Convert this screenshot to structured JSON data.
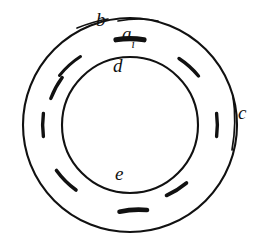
{
  "figure": {
    "type": "annular-ring-diagram",
    "background_color": "#ffffff",
    "stroke_color": "#111111",
    "labels": [
      {
        "id": "b",
        "text": "b",
        "subscript": "",
        "description": "label for outer dashed arc segment, upper left"
      },
      {
        "id": "a",
        "text": "a",
        "subscript": "i",
        "description": "label for thick top dash element"
      },
      {
        "id": "d",
        "text": "d",
        "subscript": "",
        "description": "label for inner circle boundary"
      },
      {
        "id": "c",
        "text": "c",
        "subscript": "",
        "description": "label for outer circle boundary"
      },
      {
        "id": "e",
        "text": "e",
        "subscript": "",
        "description": "label for inner disc region"
      }
    ],
    "circles": [
      {
        "id": "outer-circle",
        "cx": 130,
        "cy": 125,
        "r": 107,
        "label_ref": "c"
      },
      {
        "id": "inner-circle",
        "cx": 130,
        "cy": 125,
        "r": 68,
        "label_ref": "d"
      }
    ],
    "dashes": {
      "count": 9,
      "ring_radius": 87,
      "description": "short arc segments spaced around the annulus between the inner and outer circles",
      "items": [
        {
          "id": "dash-top",
          "angle_deg": 270,
          "length_deg": 17,
          "thick": true,
          "label_ref": "a"
        },
        {
          "id": "dash-upper-left",
          "angle_deg": 225,
          "length_deg": 15,
          "thick": false,
          "label_ref": "b"
        },
        {
          "id": "dash-upper-left2",
          "angle_deg": 208,
          "length_deg": 14,
          "thick": false,
          "label_ref": ""
        },
        {
          "id": "dash-left",
          "angle_deg": 180,
          "length_deg": 15,
          "thick": false,
          "label_ref": ""
        },
        {
          "id": "dash-lower-left",
          "angle_deg": 140,
          "length_deg": 15,
          "thick": false,
          "label_ref": ""
        },
        {
          "id": "dash-bottom",
          "angle_deg": 90,
          "length_deg": 14,
          "thick": true,
          "label_ref": ""
        },
        {
          "id": "dash-lower-right",
          "angle_deg": 42,
          "length_deg": 15,
          "thick": false,
          "label_ref": ""
        },
        {
          "id": "dash-right",
          "angle_deg": 0,
          "length_deg": 15,
          "thick": false,
          "label_ref": ""
        },
        {
          "id": "dash-upper-right",
          "angle_deg": 322,
          "length_deg": 14,
          "thick": false,
          "label_ref": ""
        }
      ]
    },
    "leaders": [
      {
        "id": "leader-b",
        "from": "label b",
        "to": "upper-left ring arc"
      },
      {
        "id": "leader-a",
        "from": "label a_i",
        "to": "top thick dash"
      },
      {
        "id": "leader-c",
        "from": "label c",
        "to": "outer circle right edge"
      }
    ]
  }
}
